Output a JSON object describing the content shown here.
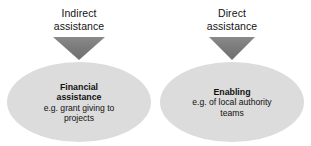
{
  "diagram": {
    "type": "two-branch-flow",
    "background_color": "#ffffff",
    "arrow_color": "#7d7d7d",
    "ellipse_color": "#dcdcdc",
    "text_color": "#111111",
    "branches": [
      {
        "id": "indirect",
        "caption": {
          "line1": "Indirect",
          "line2": "assistance"
        },
        "arrow": "down-triangle-icon",
        "node": {
          "title_line1": "Financial",
          "title_line2": "assistance",
          "detail_line1": "e.g. grant giving to",
          "detail_line2": "projects"
        }
      },
      {
        "id": "direct",
        "caption": {
          "line1": "Direct",
          "line2": "assistance"
        },
        "arrow": "down-triangle-icon",
        "node": {
          "title_line1": "Enabling",
          "title_line2": "",
          "detail_line1": "e.g. of local authority",
          "detail_line2": "teams"
        }
      }
    ]
  }
}
